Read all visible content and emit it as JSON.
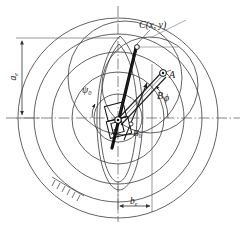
{
  "figure": {
    "type": "mechanism-kinematic-diagram",
    "background_color": "#ffffff",
    "line_color": "#2b2b2b",
    "thin_line_color": "#555555",
    "width": 244,
    "height": 225
  },
  "labels": {
    "coupler_point": "C(x, y)",
    "joint_a": "A",
    "joint_b": "B",
    "fixed_pivot_a0": "A",
    "fixed_pivot_a0_sub": "0",
    "fixed_pivot_b0": "B",
    "fixed_pivot_b0_sub": "0",
    "angle_phi": "ϕ",
    "angle_psi": "ψ",
    "angle_psi_sub": "0",
    "dim_vertical": "a",
    "dim_vertical_sub": "e",
    "dim_horizontal": "b",
    "dim_horizontal_sub": "e"
  },
  "geometry": {
    "center": {
      "x": 118,
      "y": 118
    },
    "circles": [
      {
        "name": "outer-circle",
        "cx": 118,
        "cy": 118,
        "r": 100
      },
      {
        "name": "second-circle",
        "cx": 118,
        "cy": 118,
        "r": 84
      },
      {
        "name": "third-circle",
        "cx": 118,
        "cy": 118,
        "r": 66
      },
      {
        "name": "inner-circle",
        "cx": 118,
        "cy": 118,
        "r": 46
      },
      {
        "name": "small-circle",
        "cx": 118,
        "cy": 118,
        "r": 24
      },
      {
        "name": "upper-offset-circle",
        "cx": 125,
        "cy": 78,
        "r": 57
      },
      {
        "name": "right-offset-circle",
        "cx": 150,
        "cy": 85,
        "r": 48
      }
    ],
    "axes": {
      "horizontal_y": 118,
      "vertical_x": 118
    },
    "dimension_vertical": {
      "x": 22,
      "y_top": 38,
      "y_bottom": 118
    },
    "dimension_horizontal": {
      "y": 206,
      "x_left": 118,
      "x_right": 152
    }
  }
}
